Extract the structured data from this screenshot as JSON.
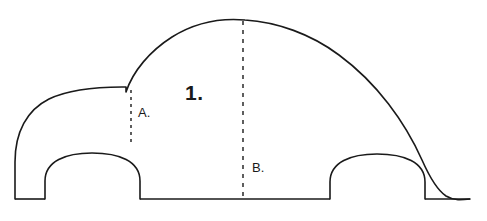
{
  "diagram": {
    "background_color": "#ffffff",
    "stroke_color": "#1a1a1a",
    "stroke_width": 1.6,
    "fill": "none",
    "canvas": {
      "width": 487,
      "height": 221
    }
  },
  "labels": {
    "main": {
      "text": "1.",
      "name": "callout-1",
      "x": 185,
      "y": 82,
      "font_size": 21,
      "bold": true
    },
    "a": {
      "text": "A.",
      "name": "callout-a",
      "x": 138,
      "y": 106,
      "font_size": 13,
      "bold": false
    },
    "b": {
      "text": "B.",
      "name": "callout-b",
      "x": 252,
      "y": 161,
      "font_size": 13,
      "bold": false
    }
  },
  "measure_lines": [
    {
      "name": "dashed-line-a",
      "label": "A.",
      "x": 131,
      "y_top": 90,
      "y_bottom": 145,
      "dash": "3 4",
      "color": "#1a1a1a",
      "width": 1.4
    },
    {
      "name": "dashed-line-b",
      "label": "B.",
      "x": 243,
      "y_top": 21,
      "y_bottom": 199,
      "dash": "4 5",
      "color": "#1a1a1a",
      "width": 1.4
    }
  ],
  "paths": {
    "body_outline": "M 15 199 L 15 160 C 15 130 28 108 50 98 C 70 89 100 88 123 88 L 127 88 L 127 92 C 134 72 150 52 172 38 C 196 23 224 19 246 20 C 278 21 312 33 340 54 C 378 82 406 122 423 160 C 431 178 437 190 446 196 C 455 201 463 200 470 199",
    "ground_front": "M 15 199 L 45 199",
    "ground_middle": "M 140 199 L 330 199",
    "ground_rear": "M 425 199 L 470 199",
    "wheel_arch_front": "M 45 199 L 45 182 C 45 161 65 153 92 153 C 120 153 140 162 140 183 L 140 199",
    "wheel_arch_rear": "M 330 199 L 330 183 C 330 162 350 154 377 154 C 405 154 425 163 425 184 L 425 199",
    "hood_to_windshield_joint": "M 123 88 L 127 88 L 127 92"
  }
}
